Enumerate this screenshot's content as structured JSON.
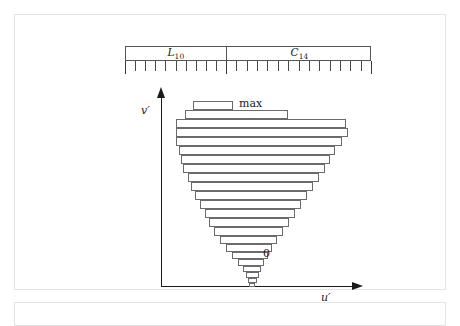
{
  "figure": {
    "kind": "histogram-funnel-diagram",
    "background": "#ffffff",
    "line_color": "#6b6b6b",
    "axis_color": "#1a1a1a",
    "frame_color": "#e3e3e3"
  },
  "ruler": {
    "name": "scale-ruler",
    "segments": [
      {
        "id": "L10",
        "label_base": "L",
        "label_sub": "10",
        "tick_count": 10
      },
      {
        "id": "C14",
        "label_base": "C",
        "label_sub": "14",
        "tick_count": 14
      }
    ],
    "total_ticks": 24
  },
  "axes": {
    "vertical_label": "v′",
    "horizontal_label": "u′"
  },
  "annotations": {
    "top_label": "max",
    "bottom_label": "0"
  },
  "chart_data": {
    "type": "bar",
    "orientation": "horizontal",
    "title": "",
    "xlabel": "u′",
    "ylabel": "v′",
    "grid": false,
    "legend": false,
    "note": "Widths and left offsets are in plot-local pixels; rows ordered top (max) to bottom (0).",
    "categories": [
      "max",
      "b2",
      "b3",
      "b4",
      "b5",
      "b6",
      "b7",
      "b8",
      "b9",
      "b10",
      "b11",
      "b12",
      "b13",
      "b14",
      "b15",
      "b16",
      "b17",
      "b18",
      "b19",
      "b20",
      "b21",
      "b22",
      "b23"
    ],
    "rows": [
      {
        "top": 14,
        "left": 50,
        "width": 40,
        "height": 9
      },
      {
        "top": 23,
        "left": 42,
        "width": 103,
        "height": 9
      },
      {
        "top": 32,
        "left": 33,
        "width": 170,
        "height": 9
      },
      {
        "top": 41,
        "left": 33,
        "width": 172,
        "height": 9
      },
      {
        "top": 50,
        "left": 33,
        "width": 166,
        "height": 9
      },
      {
        "top": 59,
        "left": 36,
        "width": 156,
        "height": 9
      },
      {
        "top": 68,
        "left": 38,
        "width": 149,
        "height": 9
      },
      {
        "top": 77,
        "left": 40,
        "width": 142,
        "height": 9
      },
      {
        "top": 86,
        "left": 45,
        "width": 131,
        "height": 9
      },
      {
        "top": 95,
        "left": 48,
        "width": 122,
        "height": 9
      },
      {
        "top": 104,
        "left": 52,
        "width": 112,
        "height": 9
      },
      {
        "top": 113,
        "left": 57,
        "width": 101,
        "height": 9
      },
      {
        "top": 122,
        "left": 62,
        "width": 90,
        "height": 9
      },
      {
        "top": 131,
        "left": 66,
        "width": 80,
        "height": 9
      },
      {
        "top": 140,
        "left": 71,
        "width": 69,
        "height": 9
      },
      {
        "top": 149,
        "left": 77,
        "width": 57,
        "height": 8
      },
      {
        "top": 157,
        "left": 83,
        "width": 46,
        "height": 8
      },
      {
        "top": 165,
        "left": 89,
        "width": 36,
        "height": 7
      },
      {
        "top": 172,
        "left": 95,
        "width": 26,
        "height": 7
      },
      {
        "top": 179,
        "left": 100,
        "width": 18,
        "height": 6
      },
      {
        "top": 185,
        "left": 103,
        "width": 13,
        "height": 6
      },
      {
        "top": 191,
        "left": 105,
        "width": 9,
        "height": 5
      },
      {
        "top": 196,
        "left": 106,
        "width": 6,
        "height": 4
      }
    ],
    "values": [
      40,
      103,
      170,
      172,
      166,
      156,
      149,
      142,
      131,
      122,
      112,
      101,
      90,
      80,
      69,
      57,
      46,
      36,
      26,
      18,
      13,
      9,
      6
    ],
    "ylim": [
      0,
      206
    ],
    "xlim": [
      0,
      236
    ]
  }
}
